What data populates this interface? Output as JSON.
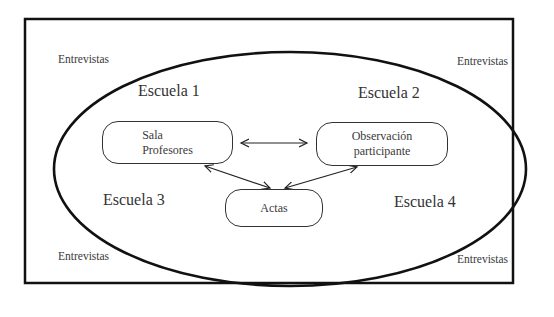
{
  "diagram": {
    "container": "outer-frame",
    "ellipse": "schools-group",
    "corner_labels": [
      {
        "id": "top-left",
        "text": "Entrevistas"
      },
      {
        "id": "top-right",
        "text": "Entrevistas"
      },
      {
        "id": "bottom-left",
        "text": "Entrevistas"
      },
      {
        "id": "bottom-right",
        "text": "Entrevistas"
      }
    ],
    "schools": [
      {
        "id": "escuela-1",
        "text": "Escuela 1"
      },
      {
        "id": "escuela-2",
        "text": "Escuela 2"
      },
      {
        "id": "escuela-3",
        "text": "Escuela 3"
      },
      {
        "id": "escuela-4",
        "text": "Escuela 4"
      }
    ],
    "nodes": [
      {
        "id": "sala-profesores",
        "lines": [
          "Sala",
          "Profesores"
        ]
      },
      {
        "id": "observacion-participante",
        "lines": [
          "Observación",
          "participante"
        ]
      },
      {
        "id": "actas",
        "lines": [
          "Actas"
        ]
      }
    ],
    "edges": [
      {
        "from": "sala-profesores",
        "to": "observacion-participante",
        "direction": "both"
      },
      {
        "from": "sala-profesores",
        "to": "actas",
        "direction": "both"
      },
      {
        "from": "observacion-participante",
        "to": "actas",
        "direction": "both"
      }
    ]
  }
}
